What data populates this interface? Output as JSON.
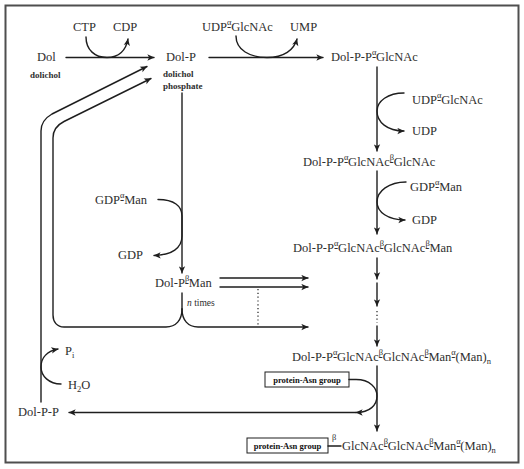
{
  "colors": {
    "line": "#1e1e1e",
    "text": "#2e2e2e",
    "border": "#4f4f4f",
    "background": "#ffffff"
  },
  "compounds": {
    "dol": {
      "label": "Dol",
      "caption": "dolichol"
    },
    "dol_p": {
      "label": "Dol-P",
      "caption": [
        "dolichol",
        "phosphate"
      ]
    },
    "intermediates": [
      [
        "Dol-P-P",
        "α",
        "-GlcNAc"
      ],
      [
        "Dol-P-P",
        "α",
        "-GlcNAc",
        "β",
        "-GlcNAc"
      ],
      [
        "Dol-P-P",
        "α",
        "-GlcNAc",
        "β",
        "-GlcNAc",
        "β",
        "-Man"
      ],
      [
        "Dol-P-P",
        "α",
        "-GlcNAc",
        "β",
        "-GlcNAc",
        "β",
        "-Man",
        "α",
        "-(Man)",
        "n"
      ]
    ],
    "dol_p_man": [
      "Dol-P",
      "β",
      "-Man"
    ],
    "n_times": [
      "n",
      " times"
    ],
    "dol_pp": "Dol-P-P",
    "protein_asn_label": "protein-Asn group",
    "product": {
      "box": "protein-Asn group",
      "chain": [
        "β",
        "GlcNAc",
        "β",
        "-GlcNAc",
        "β",
        "-Man",
        "α",
        "-(Man)",
        "n"
      ]
    }
  },
  "reagents": {
    "ctp": "CTP",
    "cdp": "CDP",
    "udp_glcnac_1": [
      "UDP",
      "α",
      "-GlcNAc"
    ],
    "ump": "UMP",
    "udp_glcnac_2": [
      "UDP",
      "α",
      "-GlcNAc"
    ],
    "udp": "UDP",
    "gdp_man_right": [
      "GDP",
      "α",
      "-Man"
    ],
    "gdp_right": "GDP",
    "gdp_man_left": [
      "GDP",
      "α",
      "-Man"
    ],
    "gdp_left": "GDP",
    "pi": [
      "P",
      "i"
    ],
    "h2o": [
      "H",
      "2",
      "O"
    ]
  }
}
